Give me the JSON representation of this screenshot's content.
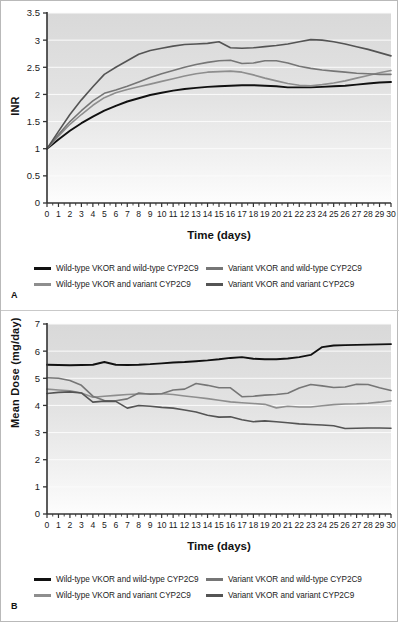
{
  "figure": {
    "background": "#ffffff",
    "border_color": "#b9b9b9",
    "panels": [
      {
        "letter": "A",
        "ylabel": "INR",
        "xlabel": "Time (days)"
      },
      {
        "letter": "B",
        "ylabel": "Mean Dose (mg/day)",
        "xlabel": "Time (days)"
      }
    ]
  },
  "series_colors": {
    "wt_vkor_wt_cyp": "#111111",
    "wt_vkor_var_cyp": "#8e8e8e",
    "var_vkor_wt_cyp": "#767676",
    "var_vkor_var_cyp": "#545454"
  },
  "legend": {
    "items": [
      {
        "label": "Wild-type VKOR and wild-type CYP2C9",
        "color": "#111111",
        "key": "wt_vkor_wt_cyp"
      },
      {
        "label": "Variant VKOR and wild-type CYP2C9",
        "color": "#767676",
        "key": "var_vkor_wt_cyp"
      },
      {
        "label": "Wild-type VKOR and variant CYP2C9",
        "color": "#8e8e8e",
        "key": "wt_vkor_var_cyp"
      },
      {
        "label": "Variant VKOR and variant CYP2C9",
        "color": "#545454",
        "key": "var_vkor_var_cyp"
      }
    ]
  },
  "chart_data": [
    {
      "type": "line",
      "panel": "A",
      "title": "",
      "xlabel": "Time (days)",
      "ylabel": "INR",
      "xlim": [
        0,
        30
      ],
      "ylim": [
        0,
        3.5
      ],
      "xticks": [
        0,
        1,
        2,
        3,
        4,
        5,
        6,
        7,
        8,
        9,
        10,
        11,
        12,
        13,
        14,
        15,
        16,
        17,
        18,
        19,
        20,
        21,
        22,
        23,
        24,
        25,
        26,
        27,
        28,
        29,
        30
      ],
      "yticks": [
        0,
        0.5,
        1,
        1.5,
        2,
        2.5,
        3,
        3.5
      ],
      "ytick_labels": [
        "0",
        "0.5",
        "1",
        "1.5",
        "2",
        "2.5",
        "3",
        "3.5"
      ],
      "grid": true,
      "legend_position": "below",
      "x": [
        0,
        1,
        2,
        3,
        4,
        5,
        6,
        7,
        8,
        9,
        10,
        11,
        12,
        13,
        14,
        15,
        16,
        17,
        18,
        19,
        20,
        21,
        22,
        23,
        24,
        25,
        26,
        27,
        28,
        29,
        30
      ],
      "series": [
        {
          "name": "Wild-type VKOR and wild-type CYP2C9",
          "color": "#111111",
          "values": [
            1.0,
            1.17,
            1.33,
            1.47,
            1.59,
            1.7,
            1.79,
            1.87,
            1.93,
            1.99,
            2.03,
            2.07,
            2.1,
            2.12,
            2.14,
            2.15,
            2.16,
            2.17,
            2.17,
            2.16,
            2.15,
            2.13,
            2.13,
            2.13,
            2.14,
            2.15,
            2.16,
            2.18,
            2.2,
            2.22,
            2.23
          ]
        },
        {
          "name": "Wild-type VKOR and variant CYP2C9",
          "color": "#8e8e8e",
          "values": [
            1.0,
            1.23,
            1.45,
            1.63,
            1.8,
            1.94,
            2.03,
            2.09,
            2.14,
            2.19,
            2.24,
            2.29,
            2.34,
            2.38,
            2.41,
            2.42,
            2.43,
            2.41,
            2.36,
            2.3,
            2.25,
            2.2,
            2.17,
            2.16,
            2.18,
            2.21,
            2.25,
            2.3,
            2.35,
            2.4,
            2.44
          ]
        },
        {
          "name": "Variant VKOR and wild-type CYP2C9",
          "color": "#767676",
          "values": [
            1.0,
            1.26,
            1.5,
            1.7,
            1.88,
            2.02,
            2.08,
            2.15,
            2.23,
            2.31,
            2.38,
            2.44,
            2.5,
            2.55,
            2.59,
            2.62,
            2.63,
            2.57,
            2.58,
            2.62,
            2.62,
            2.58,
            2.52,
            2.48,
            2.45,
            2.43,
            2.41,
            2.39,
            2.38,
            2.37,
            2.37
          ]
        },
        {
          "name": "Variant VKOR and variant CYP2C9",
          "color": "#545454",
          "values": [
            1.0,
            1.32,
            1.63,
            1.9,
            2.14,
            2.37,
            2.5,
            2.62,
            2.74,
            2.81,
            2.85,
            2.89,
            2.92,
            2.93,
            2.94,
            2.97,
            2.86,
            2.85,
            2.86,
            2.88,
            2.9,
            2.93,
            2.97,
            3.01,
            3.0,
            2.97,
            2.93,
            2.88,
            2.83,
            2.77,
            2.71
          ]
        }
      ]
    },
    {
      "type": "line",
      "panel": "B",
      "title": "",
      "xlabel": "Time (days)",
      "ylabel": "Mean Dose (mg/day)",
      "xlim": [
        0,
        30
      ],
      "ylim": [
        0,
        7
      ],
      "xticks": [
        0,
        1,
        2,
        3,
        4,
        5,
        6,
        7,
        8,
        9,
        10,
        11,
        12,
        13,
        14,
        15,
        16,
        17,
        18,
        19,
        20,
        21,
        22,
        23,
        24,
        25,
        26,
        27,
        28,
        29,
        30
      ],
      "yticks": [
        0,
        1,
        2,
        3,
        4,
        5,
        6,
        7
      ],
      "ytick_labels": [
        "0",
        "1",
        "2",
        "3",
        "4",
        "5",
        "6",
        "7"
      ],
      "grid": true,
      "legend_position": "below",
      "x": [
        0,
        1,
        2,
        3,
        4,
        5,
        6,
        7,
        8,
        9,
        10,
        11,
        12,
        13,
        14,
        15,
        16,
        17,
        18,
        19,
        20,
        21,
        22,
        23,
        24,
        25,
        26,
        27,
        28,
        29,
        30
      ],
      "series": [
        {
          "name": "Wild-type VKOR and wild-type CYP2C9",
          "color": "#111111",
          "values": [
            5.5,
            5.49,
            5.48,
            5.49,
            5.5,
            5.6,
            5.5,
            5.49,
            5.5,
            5.52,
            5.55,
            5.58,
            5.6,
            5.63,
            5.66,
            5.7,
            5.75,
            5.78,
            5.72,
            5.7,
            5.7,
            5.73,
            5.78,
            5.86,
            6.15,
            6.21,
            6.22,
            6.23,
            6.24,
            6.25,
            6.26
          ]
        },
        {
          "name": "Wild-type VKOR and variant CYP2C9",
          "color": "#8e8e8e",
          "values": [
            4.6,
            4.57,
            4.54,
            4.46,
            4.3,
            4.34,
            4.37,
            4.4,
            4.42,
            4.43,
            4.43,
            4.4,
            4.35,
            4.3,
            4.25,
            4.19,
            4.13,
            4.1,
            4.07,
            4.04,
            3.91,
            3.97,
            3.94,
            3.94,
            3.99,
            4.03,
            4.05,
            4.06,
            4.08,
            4.12,
            4.17
          ]
        },
        {
          "name": "Variant VKOR and wild-type CYP2C9",
          "color": "#767676",
          "values": [
            5.02,
            5.0,
            4.92,
            4.74,
            4.34,
            4.18,
            4.17,
            4.24,
            4.46,
            4.41,
            4.43,
            4.57,
            4.6,
            4.81,
            4.74,
            4.65,
            4.65,
            4.32,
            4.34,
            4.38,
            4.4,
            4.45,
            4.64,
            4.77,
            4.72,
            4.66,
            4.68,
            4.78,
            4.77,
            4.65,
            4.55
          ]
        },
        {
          "name": "Variant VKOR and variant CYP2C9",
          "color": "#545454",
          "values": [
            4.44,
            4.48,
            4.5,
            4.46,
            4.12,
            4.16,
            4.15,
            3.9,
            4.0,
            3.97,
            3.93,
            3.9,
            3.83,
            3.76,
            3.64,
            3.57,
            3.58,
            3.47,
            3.4,
            3.43,
            3.4,
            3.36,
            3.32,
            3.3,
            3.28,
            3.25,
            3.15,
            3.16,
            3.17,
            3.17,
            3.16
          ]
        }
      ]
    }
  ]
}
